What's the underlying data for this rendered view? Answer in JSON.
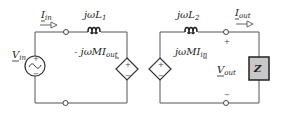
{
  "diagram": {
    "type": "circuit",
    "colors": {
      "wire": "#555555",
      "impedance_fill": "#c8c8c8",
      "background": "#ffffff"
    },
    "primary": {
      "source_label": "V",
      "source_sub": "in",
      "current_label": "I",
      "current_sub": "in",
      "inductor_label": "jωL",
      "inductor_sub": "1",
      "dependent_label": "- jωMI",
      "dependent_sub": "out",
      "plus": "+",
      "minus": "−"
    },
    "secondary": {
      "inductor_label": "jωL",
      "inductor_sub": "2",
      "dependent_label": "jωMI",
      "dependent_sub": "in",
      "current_label": "I",
      "current_sub": "out",
      "voltage_label": "V",
      "voltage_sub": "out",
      "load_label": "Z",
      "plus": "+",
      "minus": "−"
    }
  }
}
